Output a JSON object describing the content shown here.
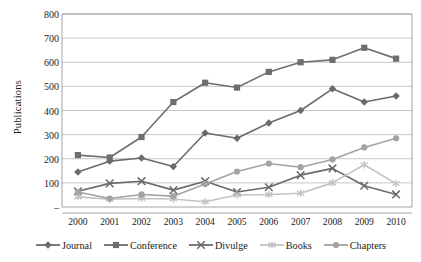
{
  "chart_data": {
    "type": "line",
    "title": "",
    "xlabel": "",
    "ylabel": "Publications",
    "categories": [
      "2000",
      "2001",
      "2002",
      "2003",
      "2004",
      "2005",
      "2006",
      "2007",
      "2008",
      "2009",
      "2010"
    ],
    "ylim": [
      0,
      800
    ],
    "yticks": [
      "800",
      "700",
      "600",
      "500",
      "400",
      "300",
      "200",
      "100",
      "–"
    ],
    "ytick_values": [
      800,
      700,
      600,
      500,
      400,
      300,
      200,
      100,
      0
    ],
    "grid": "horizontal",
    "legend_position": "bottom",
    "series": [
      {
        "name": "Journal",
        "marker": "diamond",
        "color": "#6b6b6b",
        "values": [
          145,
          190,
          203,
          168,
          307,
          285,
          348,
          400,
          490,
          435,
          460
        ]
      },
      {
        "name": "Conference",
        "marker": "square",
        "color": "#6e6e6e",
        "values": [
          215,
          205,
          290,
          435,
          515,
          495,
          560,
          600,
          610,
          660,
          615
        ]
      },
      {
        "name": "Divulge",
        "marker": "cross",
        "color": "#6a6a6a",
        "values": [
          65,
          98,
          107,
          70,
          107,
          62,
          82,
          132,
          160,
          88,
          52
        ]
      },
      {
        "name": "Books",
        "marker": "star",
        "color": "#c2c2c2",
        "values": [
          42,
          32,
          35,
          33,
          22,
          50,
          52,
          57,
          100,
          175,
          97
        ]
      },
      {
        "name": "Chapters",
        "marker": "circle",
        "color": "#a3a3a3",
        "values": [
          62,
          35,
          52,
          45,
          95,
          147,
          180,
          165,
          197,
          247,
          285
        ]
      }
    ]
  },
  "axis": {
    "y_title": "Publications"
  },
  "style": {
    "grid_color": "#b0b0b0",
    "axis_color": "#9a9a9a",
    "text_color": "#1c1c1c",
    "background": "#ffffff"
  }
}
